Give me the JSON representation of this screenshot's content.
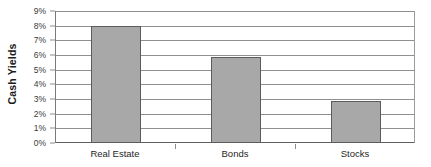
{
  "chart_data": {
    "type": "bar",
    "title": "",
    "xlabel": "",
    "ylabel": "Cash Yields",
    "categories": [
      "Real Estate",
      "Bonds",
      "Stocks"
    ],
    "values": [
      8.0,
      5.85,
      2.85
    ],
    "value_unit": "%",
    "ylim": [
      0,
      9
    ],
    "ytick_step": 1,
    "ytick_labels": [
      "0%",
      "1%",
      "2%",
      "3%",
      "4%",
      "5%",
      "6%",
      "7%",
      "8%",
      "9%"
    ],
    "grid": true,
    "legend": false,
    "orientation": "vertical",
    "series": [
      {
        "name": "Cash Yields",
        "values": [
          8.0,
          5.85,
          2.85
        ]
      }
    ],
    "colors": {
      "bar_fill": "#a8a8a8",
      "bar_border": "#5c5c5c",
      "gridline": "#8f8f8f",
      "axis": "#5f5f5f",
      "plot_background": "#ffffff",
      "text": "#1f1f1f"
    }
  }
}
